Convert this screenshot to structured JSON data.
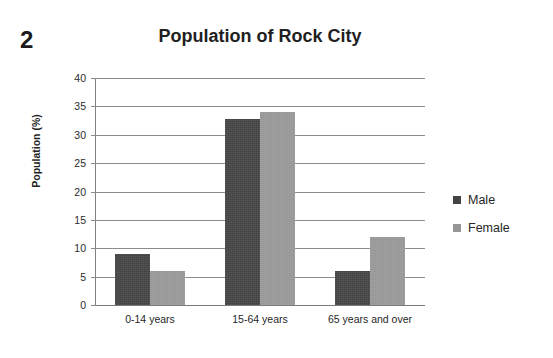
{
  "question_number": "2",
  "chart_data": {
    "type": "bar",
    "title": "Population of Rock City",
    "xlabel": "",
    "ylabel": "Population (%)",
    "categories": [
      "0-14 years",
      "15-64 years",
      "65 years and over"
    ],
    "series": [
      {
        "name": "Male",
        "color": "#434343",
        "values": [
          9,
          32.7,
          6
        ]
      },
      {
        "name": "Female",
        "color": "#969696",
        "values": [
          6,
          34,
          12
        ]
      }
    ],
    "ylim": [
      0,
      40
    ],
    "ytick_step": 5,
    "ytick_labels": [
      "40",
      "35",
      "30",
      "25",
      "20",
      "15",
      "10",
      "5",
      "0"
    ],
    "grid": true,
    "legend_position": "right"
  }
}
